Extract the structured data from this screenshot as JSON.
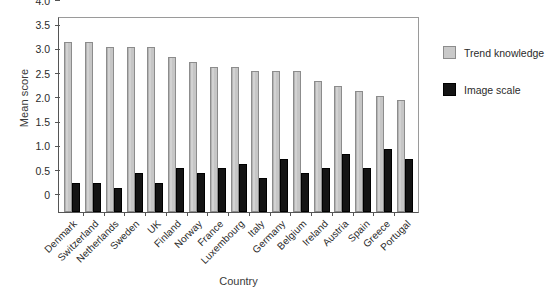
{
  "chart_data": {
    "type": "bar",
    "title": "",
    "xlabel": "Country",
    "ylabel": "Mean score",
    "ylim": [
      0,
      4.0
    ],
    "yticks": [
      "0",
      "0.5",
      "1.0",
      "1.5",
      "2.0",
      "2.5",
      "3.0",
      "3.5",
      "4.0"
    ],
    "grid": false,
    "legend_position": "right",
    "categories": [
      "Denmark",
      "Switzerland",
      "Netherlands",
      "Sweden",
      "UK",
      "Finland",
      "Norway",
      "France",
      "Luxembourg",
      "Italy",
      "Germany",
      "Belgium",
      "Ireland",
      "Austria",
      "Spain",
      "Greece",
      "Portugal"
    ],
    "series": [
      {
        "name": "Trend knowledge",
        "color": "#c9c9c9",
        "values": [
          3.5,
          3.5,
          3.4,
          3.4,
          3.4,
          3.2,
          3.1,
          3.0,
          3.0,
          2.9,
          2.9,
          2.9,
          2.7,
          2.6,
          2.5,
          2.4,
          2.3
        ]
      },
      {
        "name": "Image scale",
        "color": "#141414",
        "values": [
          0.6,
          0.6,
          0.5,
          0.8,
          0.6,
          0.9,
          0.8,
          0.9,
          1.0,
          0.7,
          1.1,
          0.8,
          0.9,
          1.2,
          0.9,
          1.3,
          1.1
        ]
      }
    ]
  }
}
